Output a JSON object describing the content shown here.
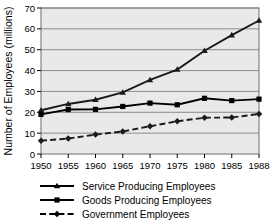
{
  "chart_data": {
    "type": "line",
    "title": "",
    "subtitle": "",
    "xlabel": "",
    "ylabel": "Number of Employees (millions)",
    "categories": [
      "1950",
      "1955",
      "1960",
      "1965",
      "1970",
      "1975",
      "1980",
      "1985",
      "1988"
    ],
    "x": [
      1950,
      1955,
      1960,
      1965,
      1970,
      1975,
      1980,
      1985,
      1988
    ],
    "xlim": [
      1950,
      1988
    ],
    "ylim": [
      0,
      70
    ],
    "yticks": [
      0,
      10,
      20,
      30,
      40,
      50,
      60,
      70
    ],
    "ytick_labels": [
      "0",
      "10",
      "20",
      "30",
      "40",
      "50",
      "60",
      "70"
    ],
    "grid": true,
    "grid_axis": "y",
    "legend_position": "bottom",
    "plot_background": "#e9e9e9",
    "grid_color": "#8c8c8c",
    "series": [
      {
        "name": "Service Producing Employees",
        "marker": "triangle",
        "line_style": "solid",
        "color": "#1a1a1a",
        "values": [
          21.0,
          24.0,
          26.0,
          29.5,
          35.5,
          40.5,
          49.5,
          57.0,
          64.0
        ]
      },
      {
        "name": "Goods Producing Employees",
        "marker": "square",
        "line_style": "solid",
        "color": "#000000",
        "values": [
          19.0,
          21.3,
          21.4,
          22.8,
          24.4,
          23.6,
          26.7,
          25.6,
          26.3
        ]
      },
      {
        "name": "Government Employees",
        "marker": "diamond",
        "line_style": "dashed",
        "color": "#1a1a1a",
        "values": [
          6.4,
          7.4,
          9.3,
          10.8,
          13.3,
          15.7,
          17.4,
          17.5,
          19.2
        ]
      }
    ]
  },
  "legend": {
    "items": [
      {
        "label": "Service Producing Employees",
        "marker": "triangle",
        "line_style": "solid"
      },
      {
        "label": "Goods Producing Employees",
        "marker": "square",
        "line_style": "solid"
      },
      {
        "label": "Government Employees",
        "marker": "diamond",
        "line_style": "dashed"
      }
    ]
  }
}
